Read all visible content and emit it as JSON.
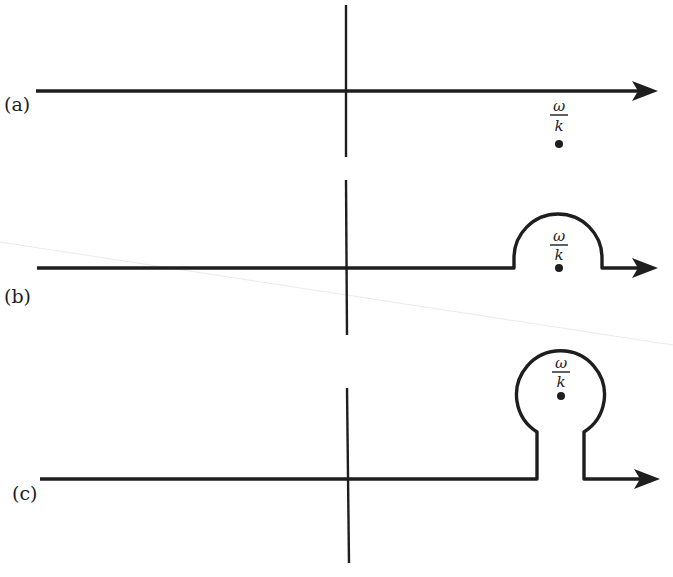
{
  "figure": {
    "panels": [
      {
        "label": "(a)",
        "description": "straight real-axis contour, pole below axis"
      },
      {
        "label": "(b)",
        "description": "contour with semicircular bump passing above pole"
      },
      {
        "label": "(c)",
        "description": "contour with keyhole loop enclosing pole"
      }
    ],
    "pole_label": {
      "numerator": "ω",
      "denominator": "k"
    },
    "colors": {
      "ink": "#1e1e1e",
      "background": "#ffffff"
    }
  }
}
